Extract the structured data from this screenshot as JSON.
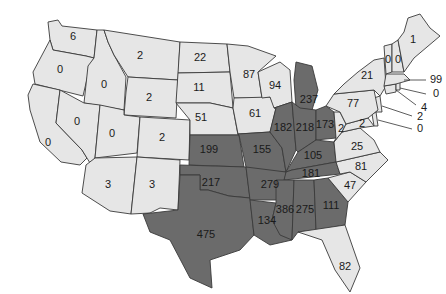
{
  "title": "",
  "colors": {
    "low": "#e6e6e6",
    "high": "#6b6b6b",
    "border": "#3a3a3a",
    "text": "#1a1a1a"
  },
  "legend": [],
  "states": [
    {
      "id": "WA",
      "value": 6,
      "shade": "low"
    },
    {
      "id": "OR",
      "value": 0,
      "shade": "low"
    },
    {
      "id": "CA",
      "value": 0,
      "shade": "low"
    },
    {
      "id": "ID",
      "value": 0,
      "shade": "low"
    },
    {
      "id": "NV",
      "value": 0,
      "shade": "low"
    },
    {
      "id": "MT",
      "value": 2,
      "shade": "low"
    },
    {
      "id": "WY",
      "value": 2,
      "shade": "low"
    },
    {
      "id": "UT",
      "value": 0,
      "shade": "low"
    },
    {
      "id": "CO",
      "value": 2,
      "shade": "low"
    },
    {
      "id": "AZ",
      "value": 3,
      "shade": "low"
    },
    {
      "id": "NM",
      "value": 3,
      "shade": "low"
    },
    {
      "id": "ND",
      "value": 22,
      "shade": "low"
    },
    {
      "id": "SD",
      "value": 11,
      "shade": "low"
    },
    {
      "id": "NE",
      "value": 51,
      "shade": "low"
    },
    {
      "id": "KS",
      "value": 199,
      "shade": "high"
    },
    {
      "id": "OK",
      "value": 217,
      "shade": "high"
    },
    {
      "id": "TX",
      "value": 475,
      "shade": "high"
    },
    {
      "id": "MN",
      "value": 87,
      "shade": "low"
    },
    {
      "id": "IA",
      "value": 61,
      "shade": "low"
    },
    {
      "id": "MO",
      "value": 155,
      "shade": "high"
    },
    {
      "id": "AR",
      "value": 279,
      "shade": "high"
    },
    {
      "id": "LA",
      "value": 134,
      "shade": "high"
    },
    {
      "id": "WI",
      "value": 94,
      "shade": "low"
    },
    {
      "id": "IL",
      "value": 182,
      "shade": "high"
    },
    {
      "id": "MI",
      "value": 237,
      "shade": "high"
    },
    {
      "id": "IN",
      "value": 218,
      "shade": "high"
    },
    {
      "id": "OH",
      "value": 173,
      "shade": "high"
    },
    {
      "id": "KY",
      "value": 105,
      "shade": "high"
    },
    {
      "id": "TN",
      "value": 181,
      "shade": "high"
    },
    {
      "id": "MS",
      "value": 386,
      "shade": "high"
    },
    {
      "id": "AL",
      "value": 275,
      "shade": "high"
    },
    {
      "id": "GA",
      "value": 111,
      "shade": "high"
    },
    {
      "id": "FL",
      "value": 82,
      "shade": "low"
    },
    {
      "id": "SC",
      "value": 47,
      "shade": "low"
    },
    {
      "id": "NC",
      "value": 81,
      "shade": "low"
    },
    {
      "id": "VA",
      "value": 25,
      "shade": "low"
    },
    {
      "id": "WV",
      "value": 2,
      "shade": "low"
    },
    {
      "id": "MD",
      "value": 2,
      "shade": "low"
    },
    {
      "id": "DE",
      "value": 0,
      "shade": "low"
    },
    {
      "id": "NJ",
      "value": 2,
      "shade": "low"
    },
    {
      "id": "PA",
      "value": 77,
      "shade": "low"
    },
    {
      "id": "NY",
      "value": 21,
      "shade": "low"
    },
    {
      "id": "CT",
      "value": 4,
      "shade": "low"
    },
    {
      "id": "RI",
      "value": 0,
      "shade": "low"
    },
    {
      "id": "MA",
      "value": 99,
      "shade": "low"
    },
    {
      "id": "VT",
      "value": 0,
      "shade": "low"
    },
    {
      "id": "NH",
      "value": 0,
      "shade": "low"
    },
    {
      "id": "ME",
      "value": 1,
      "shade": "low"
    }
  ]
}
